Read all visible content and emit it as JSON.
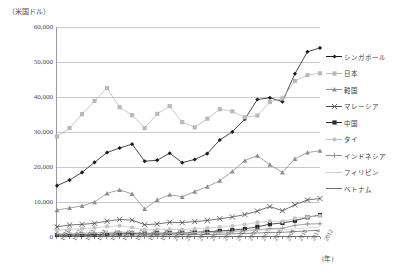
{
  "axis": {
    "y_unit_label": "（米国ドル）",
    "x_unit_label": "(年)",
    "y_ticks": [
      "60,000",
      "50,000",
      "40,000",
      "30,000",
      "20,000",
      "10,000",
      "0"
    ],
    "x_ticks": [
      "1991",
      "1992",
      "1993",
      "1994",
      "1995",
      "1996",
      "1997",
      "1998",
      "1999",
      "2000",
      "2001",
      "2002",
      "2003",
      "2004",
      "2005",
      "2006",
      "2007",
      "2008",
      "2009",
      "2010",
      "2011",
      "2012"
    ]
  },
  "legend": {
    "position": "right",
    "items": [
      {
        "label": "シンガポール",
        "marker": "diamond",
        "color": "#1a1a1a"
      },
      {
        "label": "日本",
        "marker": "square",
        "color": "#b9b9b9"
      },
      {
        "label": "韓国",
        "marker": "triangle",
        "color": "#8e8e8e"
      },
      {
        "label": "マレーシア",
        "marker": "cross",
        "color": "#4f4f4f"
      },
      {
        "label": "中国",
        "marker": "square",
        "color": "#2b2b2b"
      },
      {
        "label": "タイ",
        "marker": "circle",
        "color": "#c4c4c4"
      },
      {
        "label": "インドネシア",
        "marker": "plus",
        "color": "#909090"
      },
      {
        "label": "フィリピン",
        "marker": "none",
        "color": "#cfcfcf"
      },
      {
        "label": "ベトナム",
        "marker": "none",
        "color": "#6f6f6f"
      }
    ]
  },
  "chart_data": {
    "type": "line",
    "title": "",
    "subtitle": "",
    "xlabel": "(年)",
    "ylabel": "（米国ドル）",
    "ylim": [
      0,
      60000
    ],
    "grid": true,
    "legend_position": "right",
    "x": [
      "1991",
      "1992",
      "1993",
      "1994",
      "1995",
      "1996",
      "1997",
      "1998",
      "1999",
      "2000",
      "2001",
      "2002",
      "2003",
      "2004",
      "2005",
      "2006",
      "2007",
      "2008",
      "2009",
      "2010",
      "2011",
      "2012"
    ],
    "series": [
      {
        "name": "シンガポール",
        "marker": "diamond",
        "color": "#1a1a1a",
        "values": [
          14500,
          16100,
          18300,
          21200,
          24000,
          25300,
          26400,
          21500,
          21800,
          23800,
          21100,
          22000,
          23700,
          27600,
          29900,
          33600,
          39200,
          39700,
          38600,
          46600,
          52900,
          54000
        ]
      },
      {
        "name": "日本",
        "marker": "square",
        "color": "#b9b9b9",
        "values": [
          28600,
          31000,
          35000,
          38800,
          42500,
          37000,
          34700,
          31000,
          35100,
          37300,
          32700,
          31200,
          33700,
          36400,
          35800,
          34100,
          34600,
          38500,
          39500,
          44500,
          46200,
          46700
        ]
      },
      {
        "name": "韓国",
        "marker": "triangle",
        "color": "#8e8e8e",
        "values": [
          7500,
          8100,
          8700,
          9800,
          12300,
          13300,
          12100,
          7800,
          10400,
          11900,
          11300,
          12800,
          14200,
          15900,
          18600,
          21700,
          23100,
          20500,
          18300,
          22200,
          24000,
          24500
        ]
      },
      {
        "name": "マレーシア",
        "marker": "cross",
        "color": "#4f4f4f",
        "values": [
          2700,
          3200,
          3400,
          3700,
          4300,
          4800,
          4600,
          3300,
          3500,
          4000,
          3900,
          4200,
          4500,
          5000,
          5500,
          6200,
          7200,
          8500,
          7300,
          9000,
          10400,
          10800
        ]
      },
      {
        "name": "中国",
        "marker": "square",
        "color": "#2b2b2b",
        "values": [
          350,
          380,
          420,
          470,
          600,
          700,
          770,
          820,
          860,
          950,
          1050,
          1140,
          1280,
          1500,
          1750,
          2080,
          2700,
          3450,
          3800,
          4430,
          5430,
          6070
        ]
      },
      {
        "name": "タイ",
        "marker": "circle",
        "color": "#c4c4c4",
        "values": [
          1700,
          1950,
          2150,
          2400,
          2800,
          3000,
          2500,
          1800,
          2000,
          1970,
          1890,
          2100,
          2350,
          2600,
          2900,
          3350,
          3950,
          4350,
          4200,
          5100,
          5500,
          5850
        ]
      },
      {
        "name": "インドネシア",
        "marker": "plus",
        "color": "#909090",
        "values": [
          650,
          720,
          840,
          930,
          1030,
          1140,
          1070,
          470,
          680,
          780,
          750,
          900,
          1080,
          1160,
          1300,
          1600,
          1870,
          2180,
          2270,
          3100,
          3500,
          3560
        ]
      },
      {
        "name": "フィリピン",
        "marker": "none",
        "color": "#cfcfcf",
        "values": [
          740,
          830,
          820,
          950,
          1070,
          1170,
          1130,
          900,
          1040,
          1050,
          980,
          1010,
          1050,
          1110,
          1230,
          1450,
          1720,
          1930,
          1850,
          2140,
          2370,
          2590
        ]
      },
      {
        "name": "ベトナム",
        "marker": "none",
        "color": "#6f6f6f",
        "values": [
          140,
          160,
          190,
          230,
          290,
          340,
          360,
          350,
          370,
          400,
          420,
          450,
          490,
          560,
          690,
          790,
          910,
          1070,
          1120,
          1330,
          1530,
          1750
        ]
      }
    ]
  }
}
